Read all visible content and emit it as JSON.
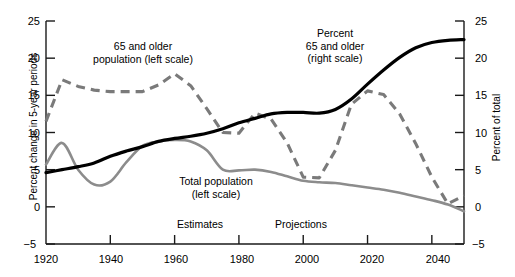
{
  "chart_data": {
    "type": "line",
    "title": "",
    "xlabel": "",
    "ylabel": "Percent change in 5-year periods",
    "ylabel_right": "Percent of total",
    "xlim": [
      1920,
      2050
    ],
    "ylim": [
      -5,
      25
    ],
    "ylim_right": [
      -5,
      25
    ],
    "grid": false,
    "legend": "inline-annotations",
    "xticks": [
      1920,
      1940,
      1960,
      1980,
      2000,
      2020,
      2040
    ],
    "yticks_left": [
      -5,
      0,
      5,
      10,
      15,
      20,
      25
    ],
    "yticks_right": [
      -5,
      0,
      5,
      10,
      15,
      20,
      25
    ],
    "annotations": [
      {
        "text": "Estimates",
        "x": 1967
      },
      {
        "text": "Projections",
        "x": 1998
      }
    ],
    "series": [
      {
        "name": "65 and older population (left scale)",
        "style": "dashed",
        "color": "#7a7a7a",
        "axis": "left",
        "x": [
          1920,
          1925,
          1930,
          1935,
          1940,
          1945,
          1950,
          1955,
          1960,
          1965,
          1970,
          1975,
          1980,
          1985,
          1990,
          1995,
          2000,
          2005,
          2010,
          2015,
          2020,
          2025,
          2030,
          2035,
          2040,
          2045,
          2050
        ],
        "values": [
          11.5,
          17.1,
          16.2,
          15.7,
          15.5,
          15.5,
          15.5,
          16.4,
          17.9,
          16.3,
          13.2,
          10.0,
          9.9,
          12.6,
          11.8,
          8.6,
          4.0,
          3.9,
          7.6,
          13.8,
          15.6,
          15.1,
          12.5,
          8.5,
          4.0,
          0.4,
          1.5
        ]
      },
      {
        "name": "Total population (left scale)",
        "style": "solid",
        "color": "#8c8c8c",
        "axis": "left",
        "x": [
          1920,
          1925,
          1930,
          1935,
          1940,
          1945,
          1950,
          1955,
          1960,
          1965,
          1970,
          1975,
          1980,
          1985,
          1990,
          1995,
          2000,
          2005,
          2010,
          2015,
          2020,
          2025,
          2030,
          2035,
          2040,
          2045,
          2050
        ],
        "values": [
          5.7,
          8.6,
          5.0,
          3.0,
          3.4,
          6.0,
          8.2,
          8.8,
          9.0,
          8.8,
          7.6,
          5.0,
          4.9,
          5.0,
          4.7,
          4.1,
          3.5,
          3.3,
          3.2,
          2.9,
          2.6,
          2.3,
          1.9,
          1.4,
          0.9,
          0.3,
          -0.6
        ]
      },
      {
        "name": "Percent 65 and older (right scale)",
        "style": "solid-bold",
        "color": "#000000",
        "axis": "right",
        "x": [
          1920,
          1925,
          1930,
          1935,
          1940,
          1945,
          1950,
          1955,
          1960,
          1965,
          1970,
          1975,
          1980,
          1985,
          1990,
          1995,
          2000,
          2005,
          2010,
          2015,
          2020,
          2025,
          2030,
          2035,
          2040,
          2045,
          2050
        ],
        "values": [
          4.6,
          5.0,
          5.4,
          5.9,
          6.8,
          7.5,
          8.1,
          8.8,
          9.2,
          9.5,
          9.9,
          10.5,
          11.3,
          11.9,
          12.5,
          12.7,
          12.7,
          12.6,
          13.1,
          14.5,
          16.5,
          18.4,
          20.1,
          21.4,
          22.1,
          22.4,
          22.5
        ]
      }
    ]
  },
  "axes": {
    "left_title": "Percent change in 5-year periods",
    "right_title": "Percent of total",
    "y_ticks": [
      "25",
      "20",
      "15",
      "10",
      "5",
      "0",
      "−5"
    ],
    "y_ticks_right": [
      "25",
      "20",
      "15",
      "10",
      "5",
      "0",
      "−5"
    ],
    "x_ticks": [
      "1920",
      "1940",
      "1960",
      "1980",
      "2000",
      "2020",
      "2040"
    ]
  },
  "series_labels": {
    "older_population": {
      "line1": "65 and older",
      "line2": "population (left scale)"
    },
    "total_population": {
      "line1": "Total population",
      "line2": "(left scale)"
    },
    "percent_older": {
      "line1": "Percent",
      "line2": "65 and older",
      "line3": "(right scale)"
    }
  },
  "phase_labels": {
    "estimates": "Estimates",
    "projections": "Projections"
  }
}
